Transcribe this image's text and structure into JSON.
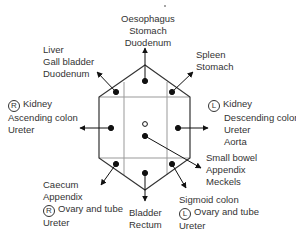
{
  "regions": {
    "top": {
      "lines": [
        "Oesophagus",
        "Stomach",
        "Duodenum"
      ]
    },
    "upper_left": {
      "lines": [
        "Liver",
        "Gall bladder",
        "Duodenum"
      ]
    },
    "upper_right": {
      "lines": [
        "Spleen",
        "Stomach"
      ]
    },
    "left": {
      "side_marker": "R",
      "lines": [
        "Kidney",
        "Ascending colon",
        "Ureter"
      ]
    },
    "right": {
      "side_marker": "L",
      "lines": [
        "Kidney",
        "Descending colon",
        "Ureter",
        "Aorta"
      ]
    },
    "center": {
      "lines": [
        "Small bowel",
        "Appendix",
        "Meckels"
      ]
    },
    "lower_left": {
      "side_marker": "R",
      "lines": [
        "Caecum",
        "Appendix",
        "Ovary and tube",
        "Ureter"
      ]
    },
    "bottom": {
      "lines": [
        "Bladder",
        "Rectum"
      ]
    },
    "lower_right": {
      "side_marker": "L",
      "lines": [
        "Sigmoid colon",
        "Ovary and tube",
        "Ureter"
      ]
    }
  },
  "colors": {
    "outline": "#333333",
    "grid": "#999999",
    "dot": "#111111"
  }
}
